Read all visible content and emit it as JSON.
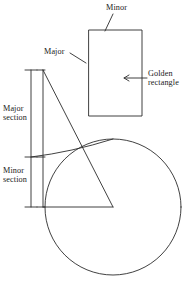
{
  "figure": {
    "stroke_color": "#2b2b2b",
    "text_color": "#1a1a1a",
    "background": "#ffffff",
    "labels": {
      "minor_top": "Minor",
      "major": "Major",
      "golden_rectangle_line1": "Golden",
      "golden_rectangle_line2": "rectangle",
      "major_section_line1": "Major",
      "major_section_line2": "section",
      "minor_section_line1": "Minor",
      "minor_section_line2": "section"
    },
    "geometry": {
      "rectangle": {
        "x": 89,
        "y": 30,
        "width": 53,
        "height": 86,
        "ratio": "1.618"
      },
      "circle": {
        "cx": 113,
        "cy": 207,
        "r": 68
      },
      "triangle": {
        "apex": [
          43,
          70
        ],
        "base_left": [
          43,
          207
        ],
        "base_right": [
          113,
          207
        ]
      },
      "measure_axis_x": 31,
      "tick_top_y": 70,
      "tick_mid_y": 157,
      "tick_bottom_y": 207,
      "arc_from": [
        31,
        157
      ],
      "arc_to": [
        113,
        139
      ],
      "arc_hypotenuse_crossing": [
        88,
        146
      ]
    }
  }
}
